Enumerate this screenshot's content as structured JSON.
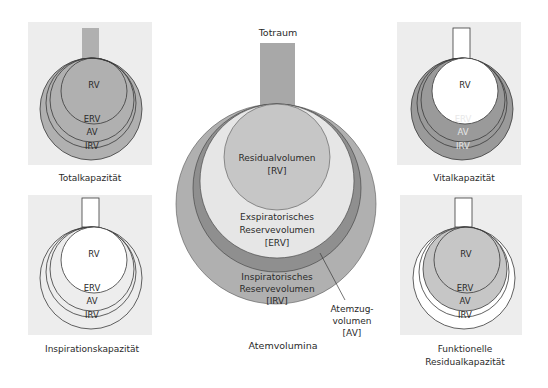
{
  "colors": {
    "panel_bg": "#ededed",
    "gray_mid": "#b0b0b0",
    "gray_dark": "#8a8a8a",
    "gray_light": "#e6e6e6",
    "white": "#ffffff",
    "stroke": "#3a3a3a"
  },
  "center": {
    "title": "Atemvolumina",
    "tube_label": "Totraum",
    "rv_line1": "Residualvolumen",
    "rv_line2": "[RV]",
    "erv_line1": "Exspiratorisches",
    "erv_line2": "Reservevolumen",
    "erv_line3": "[ERV]",
    "irv_line1": "Inspiratorisches",
    "irv_line2": "Reservevolumen",
    "irv_line3": "[IRV]",
    "av_line1": "Atemzug-",
    "av_line2": "volumen",
    "av_line3": "[AV]"
  },
  "panels": {
    "total": {
      "title": "Totalkapazität",
      "rv": "RV",
      "erv": "ERV",
      "av": "AV",
      "irv": "IRV"
    },
    "vital": {
      "title": "Vitalkapazität",
      "rv": "RV",
      "erv": "ERV",
      "av": "AV",
      "irv": "IRV"
    },
    "insp": {
      "title": "Inspirationskapazität",
      "rv": "RV",
      "erv": "ERV",
      "av": "AV",
      "irv": "IRV"
    },
    "frc": {
      "title_line1": "Funktionelle",
      "title_line2": "Residualkapazität",
      "rv": "RV",
      "erv": "ERV",
      "av": "AV",
      "irv": "IRV"
    }
  }
}
